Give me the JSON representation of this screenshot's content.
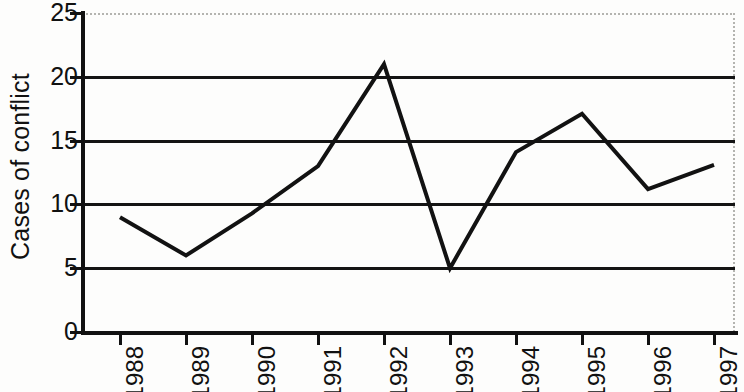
{
  "chart_data": {
    "type": "line",
    "title": "",
    "subtitle": "",
    "xlabel": "",
    "ylabel": "Cases of conflict",
    "categories": [
      "1988",
      "1989",
      "1990",
      "1991",
      "1992",
      "1993",
      "1994",
      "1995",
      "1996",
      "1997"
    ],
    "values": [
      9,
      6,
      9.3,
      13,
      21,
      5,
      14.1,
      17.1,
      11.2,
      13.1
    ],
    "series": [
      {
        "name": "Cases of conflict",
        "values": [
          9,
          6,
          9.3,
          13,
          21,
          5,
          14.1,
          17.1,
          11.2,
          13.1
        ]
      }
    ],
    "ylim": [
      0,
      25
    ],
    "yticks": [
      "0",
      "5",
      "10",
      "15",
      "20",
      "25"
    ],
    "ytick_values": [
      0,
      5,
      10,
      15,
      20,
      25
    ],
    "gridlines": [
      5,
      10,
      15,
      20
    ],
    "grid": true,
    "legend": "none",
    "line_color": "#121212",
    "grid_color": "#141414",
    "axis_color": "#111111",
    "background_color": "#fdfdfc",
    "xtick_rotation": "90",
    "ylabel_rotation": "90"
  }
}
